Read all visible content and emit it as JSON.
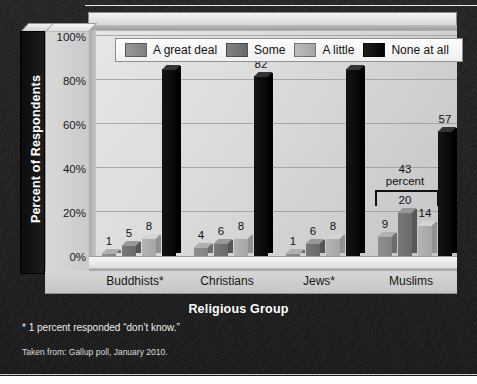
{
  "chart_data": {
    "type": "bar",
    "title": "",
    "xlabel": "Religious Group",
    "ylabel": "Percent of Respondents",
    "ylim": [
      0,
      100
    ],
    "ytick_labels": [
      "0%",
      "20%",
      "40%",
      "60%",
      "80%",
      "100%"
    ],
    "ytick_values": [
      0,
      20,
      40,
      60,
      80,
      100
    ],
    "grid": true,
    "legend_position": "top",
    "categories": [
      "Buddhists*",
      "Christians",
      "Jews*",
      "Muslims"
    ],
    "series": [
      {
        "name": "A great deal",
        "color": "#8f8f8f",
        "values": [
          1,
          4,
          1,
          9
        ]
      },
      {
        "name": "Some",
        "color": "#787878",
        "values": [
          5,
          6,
          6,
          20
        ]
      },
      {
        "name": "A little",
        "color": "#b4b4b4",
        "values": [
          8,
          8,
          8,
          14
        ]
      },
      {
        "name": "None at all",
        "color": "#141414",
        "values": [
          85,
          82,
          85,
          57
        ]
      }
    ],
    "annotations": [
      {
        "text_line1": "43",
        "text_line2": "percent",
        "spans_category": "Muslims",
        "spans_series": [
          "A great deal",
          "Some",
          "A little"
        ],
        "value": 43
      }
    ]
  },
  "footnotes": {
    "asterisk_note": "* 1 percent responded “don’t know.”",
    "source_note": "Taken from: Gallup poll, January 2010."
  }
}
